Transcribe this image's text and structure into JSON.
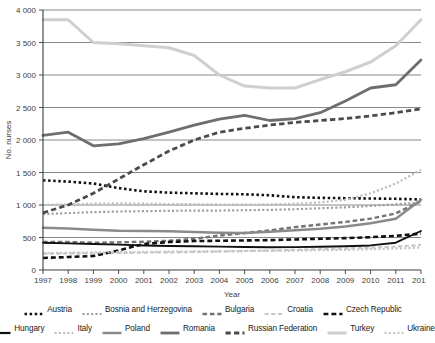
{
  "chart_data": {
    "type": "line",
    "title": "",
    "xlabel": "Year",
    "ylabel": "No. nurses",
    "x": [
      1997,
      1998,
      1999,
      2000,
      2001,
      2002,
      2003,
      2004,
      2005,
      2006,
      2007,
      2008,
      2009,
      2010,
      2011,
      2012
    ],
    "xtick_labels": [
      "1997",
      "1998",
      "1999",
      "2000",
      "2001",
      "2002",
      "2003",
      "2004",
      "2005",
      "2006",
      "2007",
      "2008",
      "2009",
      "2010",
      "2011",
      "2012"
    ],
    "ytick_labels": [
      "0",
      "500",
      "1 000",
      "1 500",
      "2 000",
      "2 500",
      "3 000",
      "3 500",
      "4 000"
    ],
    "yticks": [
      0,
      500,
      1000,
      1500,
      2000,
      2500,
      3000,
      3500,
      4000
    ],
    "ylim": [
      0,
      4000
    ],
    "grid": true,
    "legend_position": "bottom",
    "series": [
      {
        "name": "Austria",
        "color": "#111111",
        "style": "dotted",
        "width": 2.6,
        "values": [
          1380,
          1360,
          1330,
          1260,
          1210,
          1190,
          1180,
          1170,
          1165,
          1150,
          1120,
          1110,
          1105,
          1100,
          1095,
          1085
        ]
      },
      {
        "name": "Bosnia and Herzegovina",
        "color": "#9e9e9e",
        "style": "dotted",
        "width": 2.2,
        "values": [
          860,
          875,
          890,
          900,
          905,
          910,
          915,
          915,
          920,
          925,
          935,
          950,
          965,
          985,
          1010,
          1040
        ]
      },
      {
        "name": "Bulgaria",
        "color": "#737373",
        "style": "dashed",
        "width": 2.4,
        "values": [
          430,
          430,
          420,
          425,
          435,
          450,
          480,
          530,
          570,
          610,
          660,
          700,
          740,
          790,
          870,
          1060
        ]
      },
      {
        "name": "Croatia",
        "color": "#c6c6c6",
        "style": "dashed",
        "width": 2.2,
        "values": [
          250,
          255,
          258,
          262,
          268,
          272,
          278,
          285,
          292,
          300,
          310,
          320,
          330,
          345,
          360,
          385
        ]
      },
      {
        "name": "Czech Republic",
        "color": "#111111",
        "style": "dashed",
        "width": 2.6,
        "values": [
          185,
          200,
          215,
          300,
          400,
          430,
          445,
          450,
          455,
          460,
          470,
          480,
          490,
          505,
          525,
          560
        ]
      },
      {
        "name": "Hungary",
        "color": "#111111",
        "style": "solid",
        "width": 1.9,
        "values": [
          420,
          410,
          400,
          390,
          378,
          370,
          365,
          360,
          355,
          350,
          352,
          358,
          365,
          378,
          420,
          600
        ]
      },
      {
        "name": "Italy",
        "color": "#bdbdbd",
        "style": "dotted",
        "width": 2.2,
        "values": [
          1000,
          1010,
          1020,
          1025,
          1020,
          1015,
          1012,
          1008,
          1005,
          1010,
          1020,
          1040,
          1080,
          1180,
          1330,
          1540
        ]
      },
      {
        "name": "Poland",
        "color": "#8a8a8a",
        "style": "solid",
        "width": 2.5,
        "values": [
          650,
          640,
          620,
          605,
          600,
          595,
          585,
          575,
          570,
          590,
          610,
          635,
          670,
          720,
          790,
          1080
        ]
      },
      {
        "name": "Romania",
        "color": "#6e6e6e",
        "style": "solid",
        "width": 2.8,
        "values": [
          2070,
          2120,
          1910,
          1940,
          2020,
          2120,
          2230,
          2320,
          2380,
          2300,
          2330,
          2420,
          2600,
          2800,
          2850,
          3230
        ]
      },
      {
        "name": "Russian Federation",
        "color": "#4a4a4a",
        "style": "dashed",
        "width": 2.8,
        "values": [
          880,
          1000,
          1180,
          1400,
          1620,
          1830,
          2000,
          2120,
          2180,
          2230,
          2270,
          2300,
          2330,
          2370,
          2420,
          2480
        ]
      },
      {
        "name": "Turkey",
        "color": "#cfcfcf",
        "style": "solid",
        "width": 3.0,
        "values": [
          3850,
          3850,
          3500,
          3480,
          3450,
          3420,
          3300,
          3000,
          2830,
          2800,
          2800,
          2930,
          3050,
          3200,
          3450,
          3850
        ]
      },
      {
        "name": "Ukraine",
        "color": "#c6c6c6",
        "style": "dotted",
        "width": 2.2,
        "values": [
          260,
          265,
          270,
          275,
          278,
          282,
          285,
          288,
          292,
          295,
          300,
          305,
          310,
          320,
          330,
          345
        ]
      }
    ]
  },
  "legend": {
    "rows": [
      [
        "Austria",
        "Bosnia and Herzegovina",
        "Bulgaria",
        "Croatia",
        "Czech Republic"
      ],
      [
        "Hungary",
        "Italy",
        "Poland",
        "Romania",
        "Russian Federation",
        "Turkey",
        "Ukraine"
      ]
    ]
  }
}
